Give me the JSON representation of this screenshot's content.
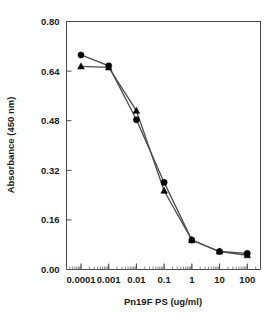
{
  "chart_data": {
    "type": "line",
    "title": "",
    "subtitle": "",
    "xlabel": "Pn19F PS (ug/ml)",
    "ylabel": "Absorbance (450 nm)",
    "xscale": "log",
    "xlim": [
      3e-05,
      300
    ],
    "ylim": [
      0.0,
      0.8
    ],
    "grid": false,
    "legend": "none",
    "x": [
      0.0001,
      0.001,
      0.01,
      0.1,
      1,
      10,
      100
    ],
    "xtick_labels": [
      "0.0001",
      "0.001",
      "0.01",
      "0.1",
      "1",
      "10",
      "100"
    ],
    "ytick_labels": [
      "0.00",
      "0.16",
      "0.32",
      "0.48",
      "0.64",
      "0.80"
    ],
    "ytick_values": [
      0.0,
      0.16,
      0.32,
      0.48,
      0.64,
      0.8
    ],
    "series": [
      {
        "name": "circle-series",
        "marker": "circle",
        "values": [
          0.692,
          0.657,
          0.483,
          0.281,
          0.095,
          0.058,
          0.052
        ]
      },
      {
        "name": "triangle-series",
        "marker": "triangle",
        "values": [
          0.655,
          0.652,
          0.512,
          0.254,
          0.095,
          0.058,
          0.046
        ]
      }
    ],
    "colors": {
      "line": "#4d4d4d",
      "marker": "#000000",
      "axis": "#4a4a4a",
      "text": "#1a1a1a",
      "background": "#ffffff"
    }
  }
}
